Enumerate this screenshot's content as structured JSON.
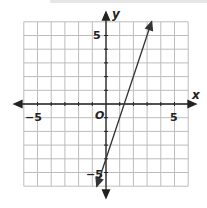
{
  "chart_data": {
    "type": "line",
    "title": "",
    "xlabel": "x",
    "ylabel": "y",
    "origin_label": "O",
    "xlim": [
      -6,
      6
    ],
    "ylim": [
      -6,
      6
    ],
    "grid": true,
    "x_tick_labels": [
      {
        "value": -5,
        "label": "−5"
      },
      {
        "value": 5,
        "label": "5"
      }
    ],
    "y_tick_labels": [
      {
        "value": 5,
        "label": "5"
      },
      {
        "value": -5,
        "label": "−5"
      }
    ],
    "series": [
      {
        "name": "line",
        "equation": "y = 3x - 4",
        "points": [
          {
            "x": -0.67,
            "y": -6
          },
          {
            "x": 0,
            "y": -4
          },
          {
            "x": 1.33,
            "y": 0
          },
          {
            "x": 3.33,
            "y": 6
          }
        ],
        "arrows_both_ends": true,
        "color": "#333333"
      }
    ]
  },
  "labels": {
    "x_axis": "x",
    "y_axis": "y",
    "origin": "O",
    "x_neg5": "−5",
    "x_pos5": "5",
    "y_pos5": "5",
    "y_neg5": "−5"
  },
  "colors": {
    "grid": "#bdbdbd",
    "axis": "#222222",
    "line": "#333333"
  }
}
